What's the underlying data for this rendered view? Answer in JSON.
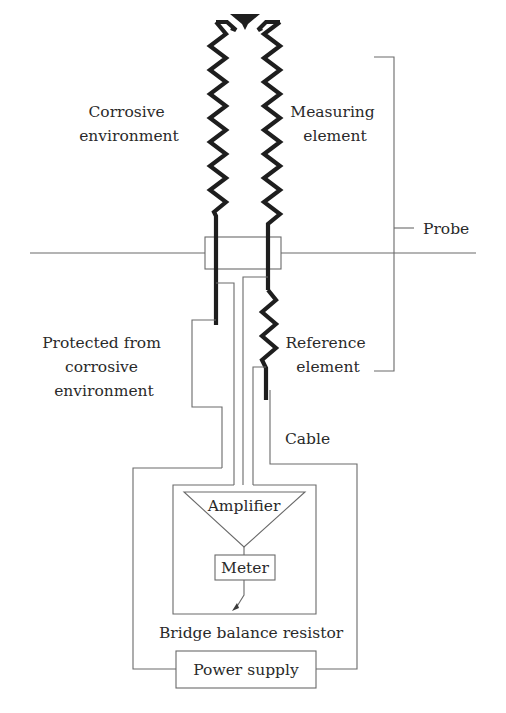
{
  "diagram": {
    "labels": {
      "corrosive_environment": [
        "Corrosive",
        "environment"
      ],
      "measuring_element": [
        "Measuring",
        "element"
      ],
      "probe": "Probe",
      "protected": [
        "Protected from",
        "corrosive",
        "environment"
      ],
      "reference_element": [
        "Reference",
        "element"
      ],
      "cable": "Cable",
      "amplifier": "Amplifier",
      "meter": "Meter",
      "bridge_balance_resistor": "Bridge balance resistor",
      "power_supply": "Power supply"
    },
    "colors": {
      "element_stroke": "#1e1e1e",
      "wire_stroke": "#6a6a6a",
      "text": "#2a2a2a"
    }
  }
}
